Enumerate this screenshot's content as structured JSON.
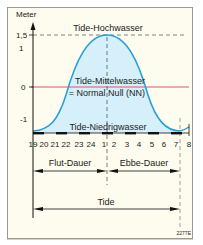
{
  "diagram": {
    "y_axis_label": "Meter",
    "y_ticks": [
      {
        "label": "1,5",
        "value": 1.5
      },
      {
        "label": "1",
        "value": 1
      },
      {
        "label": "0",
        "value": 0
      },
      {
        "label": "-1",
        "value": -1
      }
    ],
    "labels": {
      "high_water": "Tide-Hochwasser",
      "mean_water_line1": "Tide-Mittelwasser",
      "mean_water_line2": "= Normal Null (NN)",
      "low_water": "Tide-Niedrigwasser",
      "flood_duration": "Flut-Dauer",
      "ebb_duration": "Ebbe-Dauer",
      "tide": "Tide",
      "figure_id": "2277E"
    },
    "time_ticks": [
      "19",
      "20",
      "21",
      "22",
      "23",
      "24",
      "1",
      "2",
      "3",
      "4",
      "5",
      "6",
      "7",
      "8"
    ],
    "colors": {
      "curve": "#2a9fd6",
      "curve_fill": "#d6f0fb",
      "zero_line": "#e0556a",
      "background": "#fdfcee",
      "axis": "#111111",
      "dashed": "#555555"
    }
  }
}
